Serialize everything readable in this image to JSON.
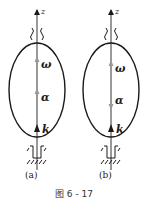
{
  "figure": {
    "caption": "图 6 - 17",
    "colors": {
      "ink": "#1a1a1a",
      "axis": "#555555",
      "vector": "#999999"
    },
    "panels": [
      {
        "id": "a",
        "sublabel": "(a)",
        "axis_label": "z",
        "vectors": [
          {
            "name": "omega",
            "label": "ω",
            "direction": "up"
          },
          {
            "name": "alpha",
            "label": "α",
            "direction": "up"
          },
          {
            "name": "k",
            "label": "k",
            "direction": "up"
          }
        ]
      },
      {
        "id": "b",
        "sublabel": "(b)",
        "axis_label": "z",
        "vectors": [
          {
            "name": "omega",
            "label": "ω",
            "direction": "up"
          },
          {
            "name": "alpha",
            "label": "α",
            "direction": "down"
          },
          {
            "name": "k",
            "label": "k",
            "direction": "up"
          }
        ]
      }
    ]
  }
}
